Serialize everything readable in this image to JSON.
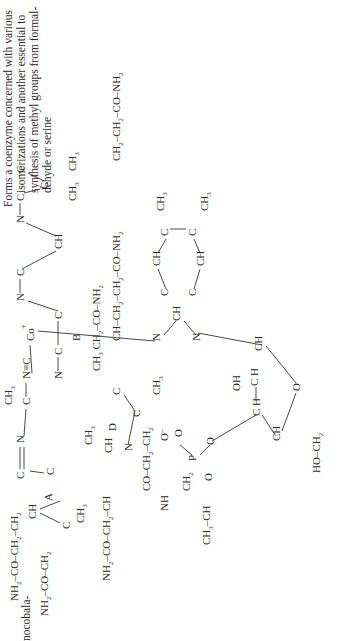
{
  "page": {
    "orientation": "rotated-90-ccw",
    "compound_label_fragment": "nocobala-",
    "description_lines": [
      "Forms a coenzyme concerned with various",
      "isomerizations and another essential to",
      "synthesis of methyl groups from formal-",
      "dehyde or serine"
    ]
  },
  "structure": {
    "name_hint": "cyanocobalamin (vitamin B12)",
    "ring_labels": [
      "A",
      "B",
      "C",
      "D"
    ],
    "center_atom": "Co",
    "ligand": "N≡C",
    "groups": {
      "top_left_1": "CH3 CH2-CO-NH2",
      "top_left_2": "CH-CH2-CH2-CO-NH2",
      "top_right": "CH2-CH2-CO-NH2",
      "bottom_1": "NH2-CO-CH2-CH2",
      "bottom_2": "NH2-CO-CH2",
      "bottom_3": "NH2-CO-CH2-CH",
      "side_chain": "CO-CH2-CH2",
      "amide": "NH",
      "propyl": "CH3-CH-CH2",
      "phosphate": "P",
      "ribose_oh": "OH",
      "ribose_end": "HO-CH2",
      "benzimidazole_methyls": [
        "CH3",
        "CH3"
      ]
    }
  }
}
